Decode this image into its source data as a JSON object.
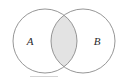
{
  "figure": {
    "kind": "venn-diagram",
    "width": 127,
    "height": 79,
    "background_color": "#ffffff",
    "stroke_color": "#8a8a8a",
    "stroke_width": 0.9,
    "intersection_fill": "#e3e3e3",
    "circle_fill": "#ffffff",
    "label_color": "#2b2b2b",
    "baseline_rule_color": "#c9c9c9"
  },
  "sets": {
    "left": {
      "label": "A",
      "cx": 45,
      "cy": 41,
      "r": 32,
      "label_x": 30,
      "label_y": 42
    },
    "right": {
      "label": "B",
      "cx": 83,
      "cy": 41,
      "r": 32,
      "label_x": 97,
      "label_y": 42
    }
  },
  "intersection": {
    "name": "A-intersect-B",
    "filled": true,
    "fill_color": "#e3e3e3",
    "top_crossing_x": 64,
    "top_crossing_y": 9,
    "bottom_crossing_x": 64,
    "bottom_crossing_y": 72
  },
  "chart_data": {
    "type": "venn",
    "title": "",
    "sets": [
      "A",
      "B"
    ],
    "shaded_regions": [
      "A ∩ B"
    ],
    "unshaded_regions": [
      "A only",
      "B only"
    ],
    "labels": [
      "A",
      "B"
    ],
    "legend": [],
    "grid": false
  }
}
